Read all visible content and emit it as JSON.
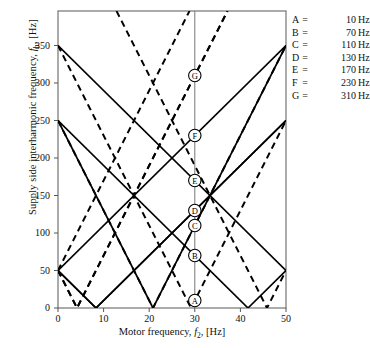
{
  "chart_data": {
    "type": "line",
    "title": "",
    "xlabel": "Motor frequency, f2, [Hz]",
    "ylabel": "Supply side interharmonic frequency, fh, [Hz]",
    "xlim": [
      0,
      50
    ],
    "ylim": [
      0,
      396
    ],
    "xticks": [
      0,
      10,
      20,
      30,
      40,
      50
    ],
    "yticks": [
      0,
      50,
      100,
      150,
      200,
      250,
      300,
      350
    ],
    "grid": false,
    "legend_position": "outside-right-top",
    "cursor_x": 30,
    "markers": [
      {
        "label": "A",
        "x": 30,
        "y": 10
      },
      {
        "label": "B",
        "x": 30,
        "y": 70
      },
      {
        "label": "C",
        "x": 30,
        "y": 110
      },
      {
        "label": "D",
        "x": 30,
        "y": 130
      },
      {
        "label": "E",
        "x": 30,
        "y": 170
      },
      {
        "label": "F",
        "x": 30,
        "y": 230
      },
      {
        "label": "G",
        "x": 30,
        "y": 310
      }
    ],
    "solid_lines": [
      {
        "name": "6f2-50",
        "slope": 6,
        "intercept": -50,
        "abs": true
      },
      {
        "name": "6f2+50",
        "slope": 6,
        "intercept": 50,
        "abs": true
      },
      {
        "name": "-6f2+50",
        "slope": -6,
        "intercept": 50,
        "abs": true
      },
      {
        "name": "-6f2+250",
        "slope": -6,
        "intercept": 250,
        "abs": true
      },
      {
        "name": "-6f2+350",
        "slope": -6,
        "intercept": 350,
        "abs": true
      },
      {
        "name": "12f2-250",
        "slope": 12,
        "intercept": -250,
        "abs": true
      }
    ],
    "dashed_lines": [
      {
        "name": "12f2-50",
        "slope": 12,
        "intercept": -50,
        "abs": true
      },
      {
        "name": "12f2+50",
        "slope": 12,
        "intercept": 50,
        "abs": true
      },
      {
        "name": "-12f2+50",
        "slope": -12,
        "intercept": 50,
        "abs": true
      },
      {
        "name": "-12f2+250",
        "slope": -12,
        "intercept": 250,
        "abs": true
      },
      {
        "name": "-12f2+350",
        "slope": -12,
        "intercept": 350,
        "abs": true
      },
      {
        "name": "12f2-550",
        "slope": 12,
        "intercept": -550,
        "abs": true
      }
    ],
    "legend": [
      {
        "key": "A",
        "eq": "=",
        "value": "10",
        "unit": "Hz"
      },
      {
        "key": "B",
        "eq": "=",
        "value": "70",
        "unit": "Hz"
      },
      {
        "key": "C",
        "eq": "=",
        "value": "110",
        "unit": "Hz"
      },
      {
        "key": "D",
        "eq": "=",
        "value": "130",
        "unit": "Hz"
      },
      {
        "key": "E",
        "eq": "=",
        "value": "170",
        "unit": "Hz"
      },
      {
        "key": "F",
        "eq": "=",
        "value": "230",
        "unit": "Hz"
      },
      {
        "key": "G",
        "eq": "=",
        "value": "310",
        "unit": "Hz"
      }
    ]
  },
  "axes": {
    "y_label_prefix": "Supply side interharmonic frequency, ",
    "y_label_sym": "f",
    "y_label_sub": "h",
    "y_label_suffix": ", [Hz]",
    "x_label_prefix": "Motor frequency, ",
    "x_label_sym": "f",
    "x_label_sub": "2",
    "x_label_suffix": ", [Hz]",
    "yticks": [
      "0",
      "50",
      "100",
      "150",
      "200",
      "250",
      "300",
      "350"
    ],
    "xticks": [
      "0",
      "10",
      "20",
      "30",
      "40",
      "50"
    ]
  },
  "style": {
    "line_color": "#000000",
    "axis_color": "#555555",
    "background": "#ffffff"
  }
}
